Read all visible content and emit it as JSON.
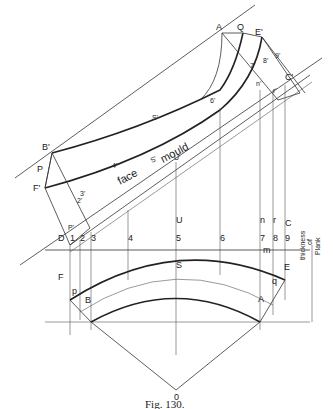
{
  "figure": {
    "caption": "Fig. 130.",
    "mould_labels": {
      "face": "face",
      "s_prime": "S'",
      "mould": "mould",
      "s_prime_top": "S'"
    },
    "thickness_label": [
      "thickness",
      "of",
      "Plank"
    ],
    "points_top": {
      "A": "A",
      "Q": "Q",
      "E_prime": "E'",
      "C_prime": "C'",
      "B_prime": "B'",
      "P": "P",
      "F_prime": "F'",
      "six_prime": "6'",
      "seven_prime": "7'",
      "eight_prime": "8'",
      "nine_prime": "9'",
      "n_prime": "n'",
      "r_prime": "r'",
      "four_prime": "4'",
      "u_prime": "U'",
      "one_prime": "1'",
      "two_prime": "2'",
      "three_prime": "3'"
    },
    "points_plan": {
      "D": "D",
      "P_prime": "P'",
      "one": "1",
      "two": "2",
      "three": "3",
      "four": "4",
      "five": "5",
      "six": "6",
      "seven": "7",
      "eight": "8",
      "nine": "9",
      "U": "U",
      "S": "S",
      "n": "n",
      "r": "r",
      "C": "C",
      "F": "F",
      "p": "p",
      "B": "B",
      "A": "A",
      "q": "q",
      "E": "E",
      "m": "m",
      "O": "0"
    }
  }
}
